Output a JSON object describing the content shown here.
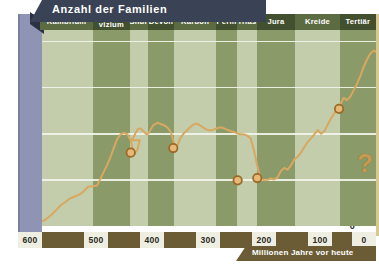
{
  "title": "Anzahl der Familien",
  "axes": {
    "y_ticks": [
      "800",
      "600",
      "400",
      "200",
      "0"
    ],
    "y_values": [
      800,
      600,
      400,
      200,
      0
    ],
    "x_ticks": [
      "600",
      "500",
      "400",
      "300",
      "200",
      "100",
      "0"
    ],
    "x_values": [
      600,
      500,
      400,
      300,
      200,
      100,
      0
    ],
    "x_label": "Millionen Jahre vor heute"
  },
  "periods": [
    {
      "label": "Kambrium",
      "start": 600,
      "end": 505
    },
    {
      "label": "Ordo-\nvizium",
      "start": 505,
      "end": 440
    },
    {
      "label": "Silur",
      "start": 440,
      "end": 408
    },
    {
      "label": "Devon",
      "start": 408,
      "end": 360
    },
    {
      "label": "Karbon",
      "start": 360,
      "end": 286
    },
    {
      "label": "Perm",
      "start": 286,
      "end": 248
    },
    {
      "label": "Trias",
      "start": 248,
      "end": 213
    },
    {
      "label": "Jura",
      "start": 213,
      "end": 144
    },
    {
      "label": "Kreide",
      "start": 144,
      "end": 65
    },
    {
      "label": "Tertiär",
      "start": 65,
      "end": 0
    }
  ],
  "annotation": "?",
  "colors": {
    "band_light": "#c3ccab",
    "band_dark": "#8b9a69",
    "curve": "#d8a860",
    "marker_fill": "#e8b878",
    "marker_stroke": "#9a6a28",
    "title_banner": "#3a4355",
    "yaxis": "#8f93b4",
    "xaxis": "#6b5c36",
    "gridline": "#f2f5ea",
    "question_mark": "#c99a4e"
  },
  "chart_data": {
    "type": "line",
    "title": "Anzahl der Familien",
    "xlabel": "Millionen Jahre vor heute",
    "ylabel": "Anzahl der Familien",
    "xlim": [
      600,
      0
    ],
    "ylim": [
      0,
      850
    ],
    "x_reversed": true,
    "grid": true,
    "legend": false,
    "series": [
      {
        "name": "Anzahl der Familien",
        "x": [
          600,
          592,
          585,
          578,
          570,
          562,
          554,
          546,
          538,
          530,
          522,
          514,
          506,
          498,
          492,
          486,
          480,
          474,
          468,
          462,
          456,
          450,
          444,
          438,
          434,
          430,
          426,
          422,
          438,
          434,
          430,
          426,
          422,
          418,
          414,
          410,
          406,
          402,
          398,
          394,
          390,
          386,
          382,
          378,
          374,
          370,
          366,
          362,
          358,
          354,
          350,
          344,
          338,
          332,
          326,
          320,
          314,
          308,
          302,
          296,
          290,
          284,
          278,
          272,
          266,
          260,
          254,
          250,
          246,
          242,
          238,
          234,
          230,
          224,
          218,
          212,
          206,
          200,
          194,
          188,
          182,
          176,
          170,
          164,
          158,
          152,
          146,
          140,
          134,
          128,
          122,
          116,
          110,
          104,
          98,
          92,
          86,
          80,
          74,
          70,
          66,
          62,
          58,
          52,
          46,
          40,
          34,
          28,
          22,
          16,
          10,
          4,
          0
        ],
        "y": [
          18,
          25,
          38,
          52,
          72,
          92,
          105,
          120,
          128,
          136,
          150,
          170,
          172,
          176,
          205,
          236,
          265,
          300,
          340,
          378,
          398,
          404,
          398,
          372,
          330,
          318,
          330,
          372,
          372,
          380,
          400,
          418,
          424,
          418,
          408,
          398,
          402,
          420,
          436,
          442,
          448,
          444,
          440,
          436,
          430,
          420,
          404,
          372,
          338,
          352,
          378,
          400,
          414,
          428,
          440,
          444,
          436,
          426,
          418,
          414,
          418,
          424,
          428,
          424,
          418,
          412,
          408,
          404,
          400,
          398,
          398,
          396,
          392,
          380,
          330,
          260,
          208,
          198,
          200,
          206,
          202,
          210,
          238,
          252,
          244,
          262,
          288,
          300,
          318,
          342,
          364,
          380,
          398,
          416,
          400,
          412,
          440,
          468,
          490,
          508,
          520,
          534,
          556,
          546,
          560,
          588,
          616,
          650,
          690,
          722,
          748,
          760,
          756
        ],
        "color": "#d8a860"
      }
    ],
    "markers": [
      {
        "name": "ordovizium-extinction",
        "x": 438,
        "y": 318
      },
      {
        "name": "devon-extinction",
        "x": 362,
        "y": 338
      },
      {
        "name": "perm-extinction",
        "x": 247,
        "y": 198
      },
      {
        "name": "trias-extinction",
        "x": 212,
        "y": 208
      },
      {
        "name": "kreide-tertiaer-extinction",
        "x": 66,
        "y": 508
      }
    ],
    "annotations": [
      {
        "text": "?",
        "x": 18,
        "y": 300
      }
    ]
  }
}
